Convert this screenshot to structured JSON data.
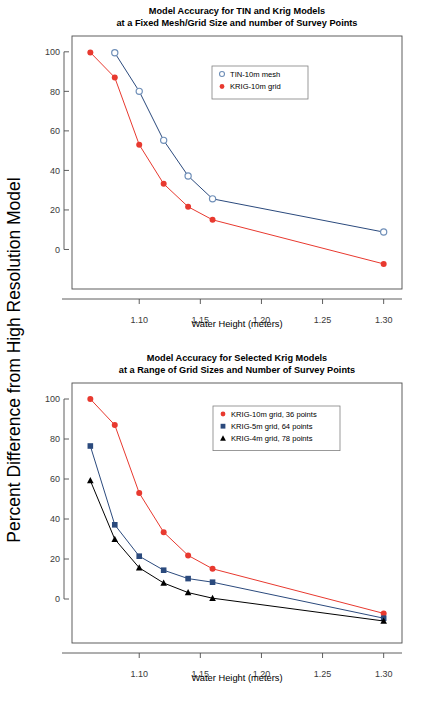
{
  "figure": {
    "width": 421,
    "height": 701,
    "background": "#ffffff",
    "shared_ylabel": "Percent Difference from High Resolution Model"
  },
  "colors": {
    "red": "#e8392f",
    "blue": "#2b4a7d",
    "light_blue": "#6f8fb8",
    "black": "#000000",
    "axis": "#4d4d4d",
    "tick_text": "#3a3a3a"
  },
  "chart_data": [
    {
      "id": "top",
      "type": "line",
      "title": "Model Accuracy for TIN and Krig Models",
      "subtitle": "at a Fixed Mesh/Grid Size and number of Survey Points",
      "xlabel": "Water Height (meters)",
      "ylabel": "Percent Difference from High Resolution Model",
      "xlim": [
        1.045,
        1.315
      ],
      "ylim": [
        -20,
        108
      ],
      "xticks": [
        1.1,
        1.15,
        1.2,
        1.25,
        1.3
      ],
      "xtick_labels": [
        "1.10",
        "1.15",
        "1.20",
        "1.25",
        "1.30"
      ],
      "yticks": [
        0,
        20,
        40,
        60,
        80,
        100
      ],
      "ytick_labels": [
        "0",
        "20",
        "40",
        "60",
        "80",
        "100"
      ],
      "grid": false,
      "legend_position": "upper-center-right",
      "series": [
        {
          "name": "TIN-10m mesh",
          "color": "#6f8fb8",
          "line_color": "#2b4a7d",
          "marker": "open-circle",
          "x": [
            1.08,
            1.1,
            1.12,
            1.14,
            1.16,
            1.3
          ],
          "values": [
            99.5,
            80.0,
            55.2,
            37.2,
            25.6,
            8.8
          ]
        },
        {
          "name": "KRIG-10m grid",
          "color": "#e8392f",
          "line_color": "#e8392f",
          "marker": "filled-circle",
          "x": [
            1.06,
            1.08,
            1.1,
            1.12,
            1.14,
            1.16,
            1.3
          ],
          "values": [
            99.7,
            87.0,
            53.0,
            33.2,
            21.6,
            15.0,
            -7.3
          ]
        }
      ]
    },
    {
      "id": "bottom",
      "type": "line",
      "title": "Model Accuracy for Selected Krig Models",
      "subtitle": "at a Range of Grid Sizes and Number of Survey Points",
      "xlabel": "Water Height (meters)",
      "ylabel": "Percent Difference from High Resolution Model",
      "xlim": [
        1.045,
        1.315
      ],
      "ylim": [
        -22,
        108
      ],
      "xticks": [
        1.1,
        1.15,
        1.2,
        1.25,
        1.3
      ],
      "xtick_labels": [
        "1.10",
        "1.15",
        "1.20",
        "1.25",
        "1.30"
      ],
      "yticks": [
        0,
        20,
        40,
        60,
        80,
        100
      ],
      "ytick_labels": [
        "0",
        "20",
        "40",
        "60",
        "80",
        "100"
      ],
      "grid": false,
      "legend_position": "upper-center-right",
      "series": [
        {
          "name": "KRIG-10m grid, 36 points",
          "color": "#e8392f",
          "line_color": "#e8392f",
          "marker": "filled-circle",
          "x": [
            1.06,
            1.08,
            1.1,
            1.12,
            1.14,
            1.16,
            1.3
          ],
          "values": [
            100.0,
            87.0,
            53.0,
            33.4,
            21.8,
            15.1,
            -7.2
          ]
        },
        {
          "name": "KRIG-5m grid, 64 points",
          "color": "#2b4a7d",
          "line_color": "#2b4a7d",
          "marker": "filled-square",
          "x": [
            1.06,
            1.08,
            1.1,
            1.12,
            1.14,
            1.16,
            1.3
          ],
          "values": [
            76.5,
            37.1,
            21.4,
            14.4,
            10.2,
            8.4,
            -9.6
          ]
        },
        {
          "name": "KRIG-4m grid, 78 points",
          "color": "#000000",
          "line_color": "#000000",
          "marker": "filled-triangle",
          "x": [
            1.06,
            1.08,
            1.1,
            1.12,
            1.14,
            1.16,
            1.3
          ],
          "values": [
            59.2,
            29.9,
            15.6,
            8.0,
            3.2,
            0.4,
            -11.0
          ]
        }
      ]
    }
  ]
}
